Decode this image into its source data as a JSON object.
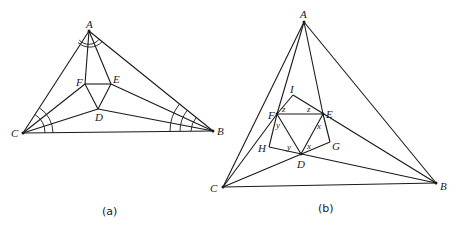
{
  "figures": [
    {
      "caption": "(a)",
      "points": {
        "A": {
          "label": "A",
          "x": 89,
          "y": 31
        },
        "B": {
          "label": "B",
          "x": 213,
          "y": 131
        },
        "C": {
          "label": "C",
          "x": 23,
          "y": 133
        },
        "D": {
          "label": "D",
          "x": 98,
          "y": 109
        },
        "E": {
          "label": "E",
          "x": 111,
          "y": 84
        },
        "F": {
          "label": "F",
          "x": 85,
          "y": 84
        }
      },
      "segments": [
        [
          "A",
          "B"
        ],
        [
          "B",
          "C"
        ],
        [
          "C",
          "A"
        ],
        [
          "A",
          "F"
        ],
        [
          "A",
          "E"
        ],
        [
          "C",
          "F"
        ],
        [
          "C",
          "D"
        ],
        [
          "B",
          "E"
        ],
        [
          "B",
          "D"
        ],
        [
          "F",
          "E"
        ],
        [
          "E",
          "D"
        ],
        [
          "D",
          "F"
        ]
      ],
      "angle_marks": {
        "A": 2,
        "B": 3,
        "C": 2
      }
    },
    {
      "caption": "(b)",
      "points": {
        "A": {
          "label": "A",
          "x": 304,
          "y": 22
        },
        "B": {
          "label": "B",
          "x": 436,
          "y": 183
        },
        "C": {
          "label": "C",
          "x": 223,
          "y": 187
        },
        "D": {
          "label": "D",
          "x": 301,
          "y": 154
        },
        "E": {
          "label": "E",
          "x": 323,
          "y": 114
        },
        "F": {
          "label": "F",
          "x": 277,
          "y": 114
        },
        "G": {
          "label": "G",
          "x": 330,
          "y": 142
        },
        "H": {
          "label": "H",
          "x": 269,
          "y": 147
        },
        "I": {
          "label": "I",
          "x": 293,
          "y": 95
        }
      },
      "angle_labels": [
        {
          "text": "z",
          "x": 282,
          "y": 110
        },
        {
          "text": "z",
          "x": 309,
          "y": 110
        },
        {
          "text": "y",
          "x": 278,
          "y": 129
        },
        {
          "text": "y",
          "x": 288,
          "y": 150
        },
        {
          "text": "x",
          "x": 318,
          "y": 130
        },
        {
          "text": "x",
          "x": 307,
          "y": 150
        }
      ]
    }
  ]
}
